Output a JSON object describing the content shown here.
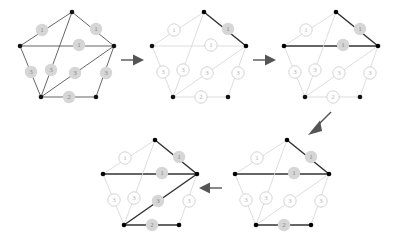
{
  "figure": {
    "background_color": "#ffffff",
    "width": 398,
    "height": 238,
    "colors": {
      "edge_dim": "#d9d9d9",
      "edge_normal": "#4a4a4a",
      "edge_selected": "#333333",
      "vertex_dim": "#cfcfcf",
      "vertex_normal": "#111111",
      "label_circle_open_fill": "#ffffff",
      "label_circle_open_stroke": "#c9c9c9",
      "label_circle_filled": "#d6d6d6",
      "label_text_dim": "#b5b5b5",
      "label_text_dark": "#888888",
      "arrow": "#555555"
    }
  },
  "graph": {
    "vertex_count": 5,
    "vertex_ids": [
      "top",
      "left",
      "right",
      "bottom_left",
      "bottom_right"
    ],
    "edges": [
      {
        "id": "top-left",
        "weight": "1",
        "from": "top",
        "to": "left"
      },
      {
        "id": "top-right",
        "weight": "1",
        "from": "top",
        "to": "right"
      },
      {
        "id": "left-right",
        "weight": "1",
        "from": "left",
        "to": "right"
      },
      {
        "id": "left-bottom_left",
        "weight": "3",
        "from": "left",
        "to": "bottom_left"
      },
      {
        "id": "top-bottom_left",
        "weight": "3",
        "from": "top",
        "to": "bottom_left"
      },
      {
        "id": "right-bottom_left",
        "weight": "3",
        "from": "right",
        "to": "bottom_left"
      },
      {
        "id": "right-bottom_right",
        "weight": "3",
        "from": "right",
        "to": "bottom_right"
      },
      {
        "id": "bottom_left-bottom_right",
        "weight": "2",
        "from": "bottom_left",
        "to": "bottom_right"
      }
    ]
  },
  "panels": [
    {
      "id": "panel-1",
      "index": 1,
      "caption": "",
      "style": "full-dark",
      "selected_edges": [],
      "labels": [
        {
          "edge": "top-left",
          "weight": "1",
          "style": "filled"
        },
        {
          "edge": "top-right",
          "weight": "1",
          "style": "filled"
        },
        {
          "edge": "left-right",
          "weight": "1",
          "style": "filled"
        },
        {
          "edge": "left-bottom_left",
          "weight": "3",
          "style": "filled"
        },
        {
          "edge": "top-bottom_left",
          "weight": "3",
          "style": "filled"
        },
        {
          "edge": "right-bottom_left",
          "weight": "3",
          "style": "filled"
        },
        {
          "edge": "right-bottom_right",
          "weight": "3",
          "style": "filled"
        },
        {
          "edge": "bottom_left-bottom_right",
          "weight": "2",
          "style": "filled"
        }
      ]
    },
    {
      "id": "panel-2",
      "index": 2,
      "caption": "",
      "style": "dim-with-selection",
      "selected_edges": [
        "top-right"
      ],
      "labels": [
        {
          "edge": "top-left",
          "weight": "1",
          "style": "open"
        },
        {
          "edge": "top-right",
          "weight": "1",
          "style": "filled"
        },
        {
          "edge": "left-right",
          "weight": "1",
          "style": "open"
        },
        {
          "edge": "left-bottom_left",
          "weight": "3",
          "style": "open"
        },
        {
          "edge": "top-bottom_left",
          "weight": "3",
          "style": "open"
        },
        {
          "edge": "right-bottom_left",
          "weight": "3",
          "style": "open"
        },
        {
          "edge": "right-bottom_right",
          "weight": "3",
          "style": "open"
        },
        {
          "edge": "bottom_left-bottom_right",
          "weight": "2",
          "style": "open"
        }
      ]
    },
    {
      "id": "panel-3",
      "index": 3,
      "caption": "",
      "style": "dim-with-selection",
      "selected_edges": [
        "top-right",
        "left-right"
      ],
      "labels": [
        {
          "edge": "top-left",
          "weight": "1",
          "style": "open"
        },
        {
          "edge": "top-right",
          "weight": "1",
          "style": "filled"
        },
        {
          "edge": "left-right",
          "weight": "1",
          "style": "filled"
        },
        {
          "edge": "left-bottom_left",
          "weight": "3",
          "style": "open"
        },
        {
          "edge": "top-bottom_left",
          "weight": "3",
          "style": "open"
        },
        {
          "edge": "right-bottom_left",
          "weight": "3",
          "style": "open"
        },
        {
          "edge": "right-bottom_right",
          "weight": "3",
          "style": "open"
        },
        {
          "edge": "bottom_left-bottom_right",
          "weight": "2",
          "style": "open"
        }
      ]
    },
    {
      "id": "panel-4",
      "index": 4,
      "caption": "",
      "style": "dim-with-selection",
      "selected_edges": [
        "top-right",
        "left-right",
        "bottom_left-bottom_right"
      ],
      "labels": [
        {
          "edge": "top-left",
          "weight": "1",
          "style": "open"
        },
        {
          "edge": "top-right",
          "weight": "1",
          "style": "filled"
        },
        {
          "edge": "left-right",
          "weight": "1",
          "style": "filled"
        },
        {
          "edge": "left-bottom_left",
          "weight": "3",
          "style": "open"
        },
        {
          "edge": "top-bottom_left",
          "weight": "3",
          "style": "open"
        },
        {
          "edge": "right-bottom_left",
          "weight": "3",
          "style": "open"
        },
        {
          "edge": "right-bottom_right",
          "weight": "3",
          "style": "open"
        },
        {
          "edge": "bottom_left-bottom_right",
          "weight": "2",
          "style": "filled"
        }
      ]
    },
    {
      "id": "panel-5",
      "index": 5,
      "caption": "",
      "style": "dim-with-selection",
      "selected_edges": [
        "top-right",
        "left-right",
        "bottom_left-bottom_right",
        "right-bottom_left"
      ],
      "labels": [
        {
          "edge": "top-left",
          "weight": "1",
          "style": "open"
        },
        {
          "edge": "top-right",
          "weight": "1",
          "style": "filled"
        },
        {
          "edge": "left-right",
          "weight": "1",
          "style": "filled"
        },
        {
          "edge": "left-bottom_left",
          "weight": "3",
          "style": "open"
        },
        {
          "edge": "top-bottom_left",
          "weight": "3",
          "style": "open"
        },
        {
          "edge": "right-bottom_left",
          "weight": "3",
          "style": "filled"
        },
        {
          "edge": "right-bottom_right",
          "weight": "3",
          "style": "open"
        },
        {
          "edge": "bottom_left-bottom_right",
          "weight": "2",
          "style": "filled"
        }
      ]
    }
  ],
  "arrows": [
    {
      "id": "arrow-1-to-2",
      "direction": "right",
      "from_panel": "panel-1",
      "to_panel": "panel-2"
    },
    {
      "id": "arrow-2-to-3",
      "direction": "right",
      "from_panel": "panel-2",
      "to_panel": "panel-3"
    },
    {
      "id": "arrow-3-to-4",
      "direction": "down-left",
      "from_panel": "panel-3",
      "to_panel": "panel-4"
    },
    {
      "id": "arrow-4-to-5",
      "direction": "left",
      "from_panel": "panel-4",
      "to_panel": "panel-5"
    }
  ],
  "weight_values": {
    "w1": "1",
    "w2": "2",
    "w3": "3"
  }
}
